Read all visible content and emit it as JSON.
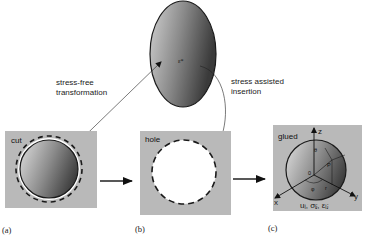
{
  "figure": {
    "inclusion": {
      "label": "ε*",
      "fill_light": "#c8c8c8",
      "fill_dark": "#3c3c3c"
    },
    "annotations": {
      "stress_free_line1": "stress-free",
      "stress_free_line2": "transformation",
      "stress_assisted_line1": "stress assisted",
      "stress_assisted_line2": "insertion"
    },
    "panels": [
      {
        "id": "a",
        "box_label": "cut",
        "caption": "(a)"
      },
      {
        "id": "b",
        "box_label": "hole",
        "caption": "(b)"
      },
      {
        "id": "c",
        "box_label": "glued",
        "caption": "(c)",
        "axes": {
          "x": "x",
          "y": "y",
          "z": "z"
        },
        "origin": "0",
        "theta": "θ",
        "phi": "φ",
        "r": "r",
        "point": "P",
        "fields": "uᵢ, σᵢⱼ, εᵢⱼ"
      }
    ],
    "colors": {
      "box_bg": "#b9b9b9",
      "outline": "#1a1a1a",
      "dash": "#1a1a1a",
      "hole_fill": "#ffffff"
    }
  }
}
